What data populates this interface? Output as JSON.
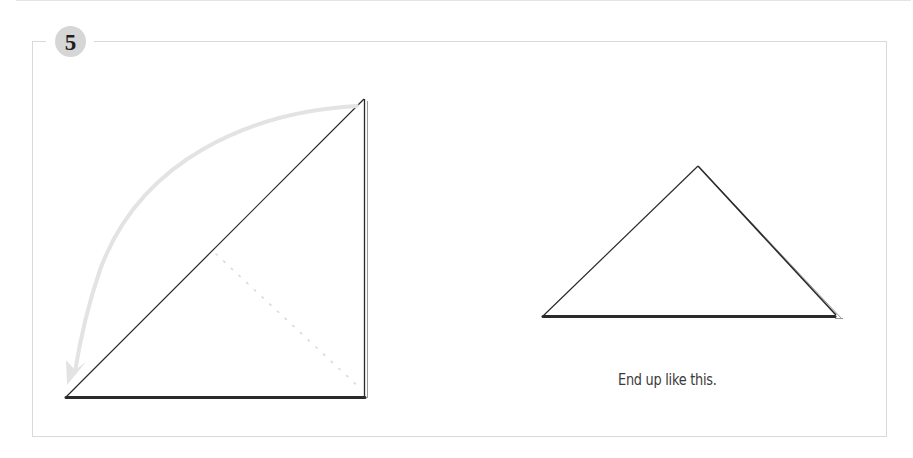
{
  "step": {
    "number": "5",
    "badge_color": "#d6d6d6"
  },
  "figures": {
    "before": {
      "description": "right triangle with fold arrow from top corner to bottom-left corner",
      "fold_arrow_color": "#e3e3e3",
      "fold_line": "dotted"
    },
    "after": {
      "description": "folded triangle result"
    }
  },
  "caption": {
    "text": "End up like this."
  },
  "colors": {
    "frame": "#d9d9d9",
    "line": "#2a2a2a",
    "text": "#3a3a3a"
  }
}
